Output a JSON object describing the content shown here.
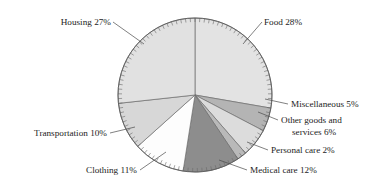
{
  "chart_data": {
    "type": "pie",
    "title": "",
    "subtitle": "",
    "xlabel": "",
    "ylabel": "",
    "legend_position": "none",
    "grid": false,
    "units": "percent",
    "total": 101,
    "start_angle_deg": 0,
    "direction": "clockwise",
    "categories": [
      "Food",
      "Miscellaneous",
      "Other goods and services",
      "Personal care",
      "Medical care",
      "Clothing",
      "Transportation",
      "Housing"
    ],
    "values": [
      28,
      5,
      6,
      2,
      12,
      11,
      10,
      27
    ],
    "slices": [
      {
        "name": "Food",
        "value": 28,
        "label": "Food 28%",
        "color": "#e3e3e3",
        "label_lines": [
          "Food 28%"
        ],
        "label_anchor": "start"
      },
      {
        "name": "Miscellaneous",
        "value": 5,
        "label": "Miscellaneous 5%",
        "color": "#b4b4b4",
        "label_lines": [
          "Miscellaneous 5%"
        ],
        "label_anchor": "start"
      },
      {
        "name": "Other goods and services",
        "value": 6,
        "label": "Other goods and services 6%",
        "color": "#dcdcdc",
        "label_lines": [
          "Other goods and",
          "services 6%"
        ],
        "label_anchor": "start"
      },
      {
        "name": "Personal care",
        "value": 2,
        "label": "Personal care 2%",
        "color": "#b9b9b9",
        "label_lines": [
          "Personal care 2%"
        ],
        "label_anchor": "start"
      },
      {
        "name": "Medical care",
        "value": 12,
        "label": "Medical care 12%",
        "color": "#8d8d8d",
        "label_lines": [
          "Medical care 12%"
        ],
        "label_anchor": "start"
      },
      {
        "name": "Clothing",
        "value": 11,
        "label": "Clothing 11%",
        "color": "#fdfdfd",
        "label_lines": [
          "Clothing 11%"
        ],
        "label_anchor": "end"
      },
      {
        "name": "Transportation",
        "value": 10,
        "label": "Transportation 10%",
        "color": "#d7d7d7",
        "label_lines": [
          "Transportation 10%"
        ],
        "label_anchor": "end"
      },
      {
        "name": "Housing",
        "value": 27,
        "label": "Housing 27%",
        "color": "#e1e1e1",
        "label_lines": [
          "Housing 27%"
        ],
        "label_anchor": "end"
      }
    ],
    "labels_text": {
      "food": "Food 28%",
      "miscellaneous": "Miscellaneous 5%",
      "other_goods_line1": "Other goods and",
      "other_goods_line2": "services 6%",
      "personal_care": "Personal care 2%",
      "medical_care": "Medical care 12%",
      "clothing": "Clothing 11%",
      "transportation": "Transportation 10%",
      "housing": "Housing 27%"
    },
    "geometry": {
      "center_x": 195,
      "center_y": 95,
      "radius": 77,
      "tick_count": 101,
      "tick_length": 4
    },
    "colors": {
      "outline": "#6e6e6e",
      "rim": "#5c5c5c",
      "leader": "#4a4a4a",
      "text": "#1c1c1c",
      "background": "#ffffff"
    }
  }
}
